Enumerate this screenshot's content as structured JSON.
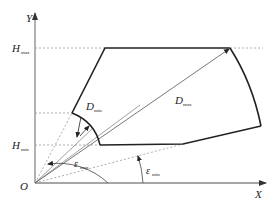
{
  "diagram": {
    "axes": {
      "x_label": "X",
      "y_label": "Y",
      "origin_label": "O"
    },
    "levels": {
      "h_max": {
        "symbol": "H",
        "subscript": "max"
      },
      "h_min": {
        "symbol": "H",
        "subscript": "min"
      }
    },
    "distances": {
      "d_min": {
        "symbol": "D",
        "subscript": "min"
      },
      "d_max": {
        "symbol": "D",
        "subscript": "max"
      }
    },
    "angles": {
      "eps_max": {
        "symbol": "ε",
        "subscript": "max"
      },
      "eps_min": {
        "symbol": "ε",
        "subscript": "min"
      }
    },
    "colors": {
      "line": "#222222",
      "axis": "#777777",
      "dash": "#888888"
    }
  }
}
